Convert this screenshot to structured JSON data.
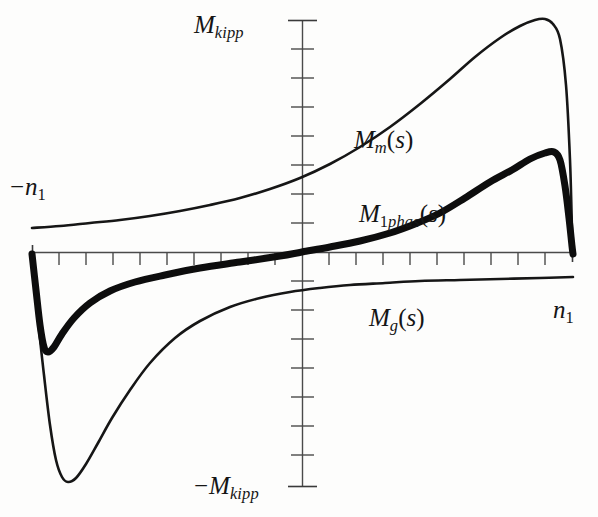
{
  "figure": {
    "type": "technical-plot",
    "background_color": "#fdfdfc",
    "ink_color": "#151515",
    "axis_color": "#4a4a4a"
  },
  "labels": {
    "y_axis_top": {
      "base": "M",
      "sub": "kipp"
    },
    "y_axis_bottom": {
      "sign": "−",
      "base": "M",
      "sub": "kipp"
    },
    "x_axis_left": {
      "sign": "−",
      "base": "n",
      "sub": "1"
    },
    "x_axis_right": {
      "base": "n",
      "sub": "1"
    },
    "curve_mm": {
      "base": "M",
      "sub": "m",
      "arg": "(s)"
    },
    "curve_m1phas": {
      "base": "M",
      "sub_upright": "1",
      "sub_italic": "phas",
      "arg": "(s)"
    },
    "curve_mg": {
      "base": "M",
      "sub": "g",
      "arg": "(s)"
    }
  },
  "chart_data": {
    "type": "line",
    "title": "",
    "xlabel": "n1",
    "ylabel": "M",
    "grid": false,
    "legend": "inline-annotations",
    "xlim": [
      -1,
      1
    ],
    "ylim": [
      -1,
      1
    ],
    "x_axis_ticks": 21,
    "y_axis_ticks": 17,
    "x_tick_labels": [
      "−n1",
      "n1"
    ],
    "y_tick_labels": [
      "M_kipp",
      "−M_kipp"
    ],
    "annotations": [
      "M_m(s)",
      "M_1phas(s)",
      "M_g(s)"
    ],
    "series": [
      {
        "name": "M_m(s)",
        "style": "thin",
        "description": "Motor torque curve: rises slowly from left, steepens, peaks near right (M_kipp), then falls abruptly to zero at n1",
        "points": [
          [
            32,
            228
          ],
          [
            60,
            226
          ],
          [
            90,
            223
          ],
          [
            120,
            220
          ],
          [
            150,
            216
          ],
          [
            180,
            211
          ],
          [
            210,
            205
          ],
          [
            240,
            198
          ],
          [
            270,
            189
          ],
          [
            300,
            178
          ],
          [
            330,
            164
          ],
          [
            360,
            147
          ],
          [
            390,
            127
          ],
          [
            420,
            104
          ],
          [
            450,
            79
          ],
          [
            475,
            57
          ],
          [
            500,
            38
          ],
          [
            520,
            26
          ],
          [
            535,
            20
          ],
          [
            545,
            19
          ],
          [
            553,
            24
          ],
          [
            560,
            39
          ],
          [
            566,
            85
          ],
          [
            570,
            160
          ],
          [
            572,
            230
          ],
          [
            573,
            255
          ]
        ]
      },
      {
        "name": "M_1phas(s)",
        "style": "thick",
        "description": "Single-phase torque curve: starts at zero at -n1, dips to a local minimum, rises through origin, peaks below M_kipp then drops to zero at n1",
        "points": [
          [
            32,
            254
          ],
          [
            36,
            290
          ],
          [
            40,
            325
          ],
          [
            44,
            347
          ],
          [
            48,
            352
          ],
          [
            54,
            347
          ],
          [
            62,
            334
          ],
          [
            74,
            318
          ],
          [
            90,
            303
          ],
          [
            110,
            291
          ],
          [
            135,
            282
          ],
          [
            165,
            275
          ],
          [
            200,
            268
          ],
          [
            240,
            262
          ],
          [
            280,
            256
          ],
          [
            302,
            252
          ],
          [
            330,
            247
          ],
          [
            360,
            241
          ],
          [
            390,
            233
          ],
          [
            415,
            224
          ],
          [
            440,
            213
          ],
          [
            465,
            198
          ],
          [
            490,
            182
          ],
          [
            512,
            170
          ],
          [
            530,
            159
          ],
          [
            545,
            153
          ],
          [
            554,
            152
          ],
          [
            560,
            160
          ],
          [
            565,
            186
          ],
          [
            569,
            218
          ],
          [
            572,
            246
          ],
          [
            573,
            254
          ]
        ]
      },
      {
        "name": "M_g(s)",
        "style": "thin",
        "description": "Generator/braking branch: plunges from zero at -n1 to a deep minimum (-M_kipp), then rises asymptotically toward zero approaching n1",
        "points": [
          [
            32,
            254
          ],
          [
            38,
            320
          ],
          [
            44,
            375
          ],
          [
            50,
            425
          ],
          [
            56,
            460
          ],
          [
            62,
            477
          ],
          [
            68,
            482
          ],
          [
            76,
            478
          ],
          [
            86,
            464
          ],
          [
            98,
            443
          ],
          [
            112,
            418
          ],
          [
            130,
            390
          ],
          [
            150,
            363
          ],
          [
            175,
            338
          ],
          [
            200,
            321
          ],
          [
            230,
            307
          ],
          [
            260,
            298
          ],
          [
            290,
            292
          ],
          [
            320,
            288
          ],
          [
            350,
            285
          ],
          [
            385,
            283
          ],
          [
            420,
            281
          ],
          [
            460,
            280
          ],
          [
            500,
            279
          ],
          [
            540,
            278
          ],
          [
            573,
            277
          ]
        ]
      }
    ]
  }
}
